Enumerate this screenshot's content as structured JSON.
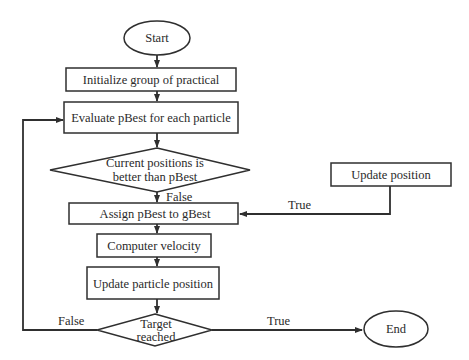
{
  "diagram": {
    "type": "flowchart",
    "colors": {
      "stroke": "#2f2f2f",
      "text": "#2a2a2a",
      "background": "#ffffff"
    },
    "nodes": {
      "start": {
        "shape": "ellipse",
        "label": "Start"
      },
      "initialize": {
        "shape": "rect",
        "label": "Initialize group of practical"
      },
      "evaluate": {
        "shape": "rect",
        "label": "Evaluate pBest for each particle"
      },
      "decision1": {
        "shape": "diamond",
        "label_line1": "Current positions is",
        "label_line2": "better than pBest"
      },
      "update_position": {
        "shape": "rect",
        "label": "Update position"
      },
      "assign": {
        "shape": "rect",
        "label": "Assign pBest to gBest"
      },
      "velocity": {
        "shape": "rect",
        "label": "Computer velocity"
      },
      "update_particle": {
        "shape": "rect",
        "label": "Update particle position"
      },
      "decision2": {
        "shape": "diamond",
        "label_line1": "Target",
        "label_line2": "reached"
      },
      "end": {
        "shape": "ellipse",
        "label": "End"
      }
    },
    "edge_labels": {
      "d1_false": "False",
      "d1_true": "True",
      "d2_false": "False",
      "d2_true": "True"
    }
  }
}
